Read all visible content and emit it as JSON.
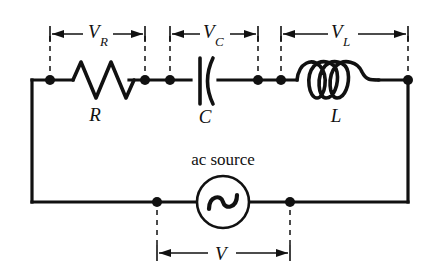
{
  "figure": {
    "type": "series-rlc-ac-circuit-diagram",
    "background_color": "#ffffff",
    "ink_color": "#111111"
  },
  "components": {
    "resistor": {
      "label": "R",
      "voltage_label": "V",
      "voltage_subscript": "R",
      "icon": "resistor-zigzag-icon",
      "zigzag_peaks": 3
    },
    "capacitor": {
      "label": "C",
      "voltage_label": "V",
      "voltage_subscript": "C",
      "icon": "capacitor-plates-icon",
      "plate_style": "straight-and-curved"
    },
    "inductor": {
      "label": "L",
      "voltage_label": "V",
      "voltage_subscript": "L",
      "icon": "inductor-coil-icon",
      "coil_loops": 3
    },
    "source": {
      "label": "ac source",
      "icon": "ac-source-sine-icon",
      "voltage_label": "V",
      "voltage_subscript": ""
    }
  },
  "dimensions": [
    {
      "name": "V_R",
      "label": "V",
      "subscript": "R",
      "position": "top-left"
    },
    {
      "name": "V_C",
      "label": "V",
      "subscript": "C",
      "position": "top-center"
    },
    {
      "name": "V_L",
      "label": "V",
      "subscript": "L",
      "position": "top-right"
    },
    {
      "name": "V",
      "label": "V",
      "subscript": "",
      "position": "bottom-center"
    }
  ],
  "nodes": {
    "count": 8,
    "description": "filled circular junction dots on the series loop"
  }
}
